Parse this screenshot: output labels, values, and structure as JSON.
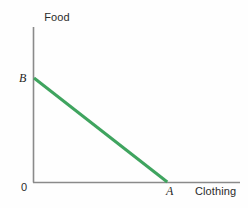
{
  "figure": {
    "type": "line-chart",
    "background_color": "#fefefe"
  },
  "axes": {
    "y_axis_title": "Food",
    "x_axis_title": "Clothing",
    "origin_label": "0",
    "axis_color": "#8a8a8a"
  },
  "labels": {
    "y_intercept": "B",
    "x_intercept": "A"
  },
  "chart_data": {
    "type": "line",
    "title": "",
    "subtitle": "",
    "xlabel": "Clothing",
    "ylabel": "Food",
    "grid": false,
    "legend": "none",
    "xlim": [
      0,
      1
    ],
    "ylim": [
      0,
      1
    ],
    "xticks": [],
    "yticks": [],
    "series": [
      {
        "name": "Budget line",
        "color": "#3fa45f",
        "linewidth": 3,
        "x": [
          0,
          0.647
        ],
        "y": [
          0.671,
          0
        ]
      }
    ],
    "annotations": [
      {
        "text": "B",
        "x": 0,
        "y": 0.671,
        "style": "italic",
        "position": "left"
      },
      {
        "text": "A",
        "x": 0.647,
        "y": 0,
        "style": "italic",
        "position": "below"
      },
      {
        "text": "0",
        "x": 0,
        "y": 0,
        "style": "normal",
        "position": "below-left"
      }
    ]
  }
}
